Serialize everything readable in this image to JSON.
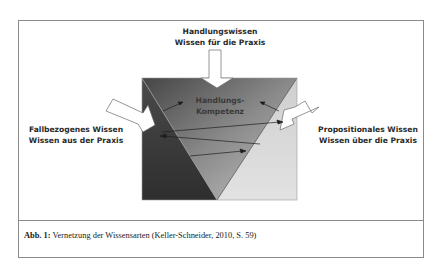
{
  "diagram": {
    "top_arrow_label": {
      "line1": "Handlungswissen",
      "line2": "Wissen für die Praxis"
    },
    "left_arrow_label": {
      "line1": "Fallbezogenes Wissen",
      "line2": "Wissen aus der Praxis"
    },
    "right_arrow_label": {
      "line1": "Propositionales Wissen",
      "line2": "Wissen über die Praxis"
    },
    "center_label": {
      "line1": "Handlungs-",
      "line2": "Kompetenz"
    },
    "colors": {
      "left_region_dark": "#3a3a3a",
      "center_triangle_top": "#5a5a5a",
      "center_triangle_bottom": "#b0b0b0",
      "right_region_light": "#dcdcdc",
      "frame": "#8a8a8a"
    }
  },
  "caption": {
    "prefix": "Abb. 1:",
    "text": " Vernetzung der Wissensarten (Keller-Schneider, 2010, S. 59)"
  }
}
